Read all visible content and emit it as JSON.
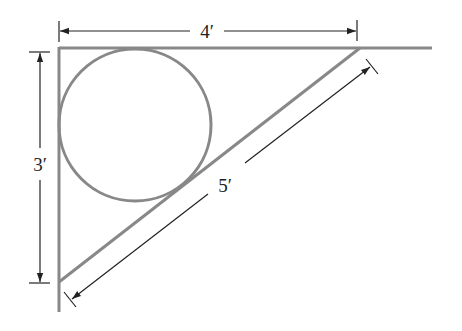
{
  "diagram": {
    "labels": {
      "top": "4′",
      "left": "3′",
      "hypotenuse": "5′"
    },
    "colors": {
      "shape_stroke": "#888888",
      "dimension_stroke": "#222222",
      "background": "#ffffff"
    }
  }
}
